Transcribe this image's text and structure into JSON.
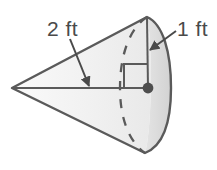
{
  "figure": {
    "kind": "cone-geometry-diagram",
    "labels": {
      "slant_height": "2 ft",
      "radius": "1 ft"
    },
    "annotations": {
      "right_angle_marker": "right-angle",
      "hidden_edge_style": "dashed",
      "center_point": "base-center-dot"
    },
    "colors": {
      "outline": "#5a5a5a",
      "fill_light": "#f2f2f2",
      "fill_shade": "#dcdcdc",
      "text": "#4a4a4a",
      "background": "#ffffff"
    },
    "geometry": {
      "apex": [
        12,
        88
      ],
      "base_center": [
        148,
        88
      ],
      "base_top": [
        147,
        17
      ],
      "base_bottom": [
        145,
        153
      ],
      "base_front_extent_x": 171,
      "base_back_extent_x": 120
    }
  }
}
